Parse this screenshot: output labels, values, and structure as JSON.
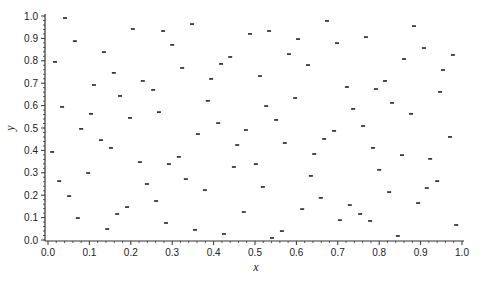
{
  "chart_data": {
    "type": "scatter",
    "title": "",
    "xlabel": "x",
    "ylabel": "y",
    "xlim": [
      0.0,
      1.0
    ],
    "ylim": [
      0.0,
      1.0
    ],
    "xticks": [
      "0.0",
      "0.1",
      "0.2",
      "0.3",
      "0.4",
      "0.5",
      "0.6",
      "0.7",
      "0.8",
      "0.9",
      "1.0"
    ],
    "yticks": [
      "0.0",
      "0.1",
      "0.2",
      "0.3",
      "0.4",
      "0.5",
      "0.6",
      "0.7",
      "0.8",
      "0.9",
      "1.0"
    ],
    "minor_ticks_per_major": 5,
    "grid": false,
    "legend": null,
    "marker": "dash",
    "marker_color": "#222222",
    "series": [
      {
        "name": "points",
        "points": [
          [
            0.041,
            0.991
          ],
          [
            0.205,
            0.942
          ],
          [
            0.065,
            0.888
          ],
          [
            0.135,
            0.839
          ],
          [
            0.017,
            0.795
          ],
          [
            0.159,
            0.746
          ],
          [
            0.229,
            0.71
          ],
          [
            0.111,
            0.692
          ],
          [
            0.174,
            0.643
          ],
          [
            0.034,
            0.594
          ],
          [
            0.104,
            0.563
          ],
          [
            0.198,
            0.545
          ],
          [
            0.08,
            0.496
          ],
          [
            0.128,
            0.446
          ],
          [
            0.152,
            0.411
          ],
          [
            0.01,
            0.393
          ],
          [
            0.222,
            0.348
          ],
          [
            0.097,
            0.299
          ],
          [
            0.027,
            0.263
          ],
          [
            0.239,
            0.25
          ],
          [
            0.051,
            0.196
          ],
          [
            0.191,
            0.147
          ],
          [
            0.167,
            0.116
          ],
          [
            0.072,
            0.098
          ],
          [
            0.143,
            0.049
          ],
          [
            0.348,
            0.964
          ],
          [
            0.278,
            0.933
          ],
          [
            0.488,
            0.92
          ],
          [
            0.3,
            0.871
          ],
          [
            0.44,
            0.817
          ],
          [
            0.418,
            0.786
          ],
          [
            0.324,
            0.768
          ],
          [
            0.394,
            0.719
          ],
          [
            0.254,
            0.67
          ],
          [
            0.386,
            0.621
          ],
          [
            0.268,
            0.571
          ],
          [
            0.411,
            0.522
          ],
          [
            0.362,
            0.473
          ],
          [
            0.478,
            0.491
          ],
          [
            0.457,
            0.424
          ],
          [
            0.316,
            0.371
          ],
          [
            0.292,
            0.339
          ],
          [
            0.449,
            0.326
          ],
          [
            0.333,
            0.272
          ],
          [
            0.379,
            0.223
          ],
          [
            0.261,
            0.174
          ],
          [
            0.473,
            0.125
          ],
          [
            0.285,
            0.076
          ],
          [
            0.355,
            0.045
          ],
          [
            0.425,
            0.027
          ],
          [
            0.674,
            0.978
          ],
          [
            0.534,
            0.933
          ],
          [
            0.604,
            0.897
          ],
          [
            0.698,
            0.879
          ],
          [
            0.582,
            0.83
          ],
          [
            0.628,
            0.781
          ],
          [
            0.512,
            0.732
          ],
          [
            0.722,
            0.683
          ],
          [
            0.597,
            0.634
          ],
          [
            0.527,
            0.598
          ],
          [
            0.737,
            0.585
          ],
          [
            0.551,
            0.536
          ],
          [
            0.691,
            0.487
          ],
          [
            0.667,
            0.451
          ],
          [
            0.572,
            0.433
          ],
          [
            0.643,
            0.384
          ],
          [
            0.502,
            0.339
          ],
          [
            0.635,
            0.286
          ],
          [
            0.519,
            0.237
          ],
          [
            0.659,
            0.188
          ],
          [
            0.729,
            0.156
          ],
          [
            0.614,
            0.138
          ],
          [
            0.705,
            0.089
          ],
          [
            0.565,
            0.04
          ],
          [
            0.541,
            0.009
          ],
          [
            0.884,
            0.955
          ],
          [
            0.768,
            0.906
          ],
          [
            0.908,
            0.857
          ],
          [
            0.978,
            0.826
          ],
          [
            0.86,
            0.808
          ],
          [
            0.954,
            0.759
          ],
          [
            0.814,
            0.71
          ],
          [
            0.792,
            0.674
          ],
          [
            0.947,
            0.661
          ],
          [
            0.831,
            0.612
          ],
          [
            0.877,
            0.563
          ],
          [
            0.761,
            0.509
          ],
          [
            0.971,
            0.46
          ],
          [
            0.785,
            0.411
          ],
          [
            0.855,
            0.379
          ],
          [
            0.923,
            0.362
          ],
          [
            0.8,
            0.313
          ],
          [
            0.94,
            0.263
          ],
          [
            0.915,
            0.232
          ],
          [
            0.824,
            0.214
          ],
          [
            0.894,
            0.165
          ],
          [
            0.754,
            0.116
          ],
          [
            0.778,
            0.085
          ],
          [
            0.986,
            0.067
          ],
          [
            0.845,
            0.018
          ]
        ]
      }
    ]
  },
  "layout": {
    "plot_left_px": 48,
    "plot_right_px": 462,
    "plot_top_px": 16,
    "plot_bottom_px": 240,
    "axis_x_px": 45,
    "axis_y_px": 241
  }
}
